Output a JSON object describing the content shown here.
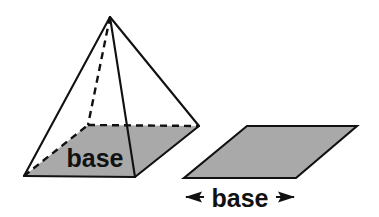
{
  "figure": {
    "type": "geometry-diagram",
    "background_color": "#ffffff",
    "stroke_color": "#111111",
    "fill_color": "#a9a9a9"
  },
  "pyramid": {
    "name": "square pyramid",
    "base_label": "base",
    "base_label_position": {
      "x": 95,
      "y": 167
    },
    "base_label_font_size": 25,
    "vertices": {
      "apex": {
        "x": 110,
        "y": 17
      },
      "base_left": {
        "x": 24,
        "y": 176
      },
      "base_front": {
        "x": 135,
        "y": 177
      },
      "base_right": {
        "x": 199,
        "y": 126
      },
      "base_back_hidden": {
        "x": 88,
        "y": 125
      }
    },
    "solid_edges": [
      [
        "apex",
        "base_left"
      ],
      [
        "apex",
        "base_front"
      ],
      [
        "apex",
        "base_right"
      ],
      [
        "base_left",
        "base_front"
      ],
      [
        "base_front",
        "base_right"
      ]
    ],
    "dashed_edges": [
      [
        "apex",
        "base_back_hidden"
      ],
      [
        "base_left",
        "base_back_hidden"
      ],
      [
        "base_back_hidden",
        "base_right"
      ]
    ],
    "base_polygon_points": "24,176 135,177 199,126 88,125"
  },
  "base_parallelogram": {
    "name": "base parallelogram",
    "points": "247,126 357,126 296,178 184,178",
    "label": "base",
    "label_position": {
      "x": 240,
      "y": 207
    },
    "label_font_size": 25,
    "dimension_arrow": {
      "left_tip": {
        "x": 185,
        "y": 197
      },
      "right_tip": {
        "x": 295,
        "y": 197
      },
      "left_arrow_name": "left-arrowhead",
      "right_arrow_name": "right-arrowhead"
    }
  }
}
